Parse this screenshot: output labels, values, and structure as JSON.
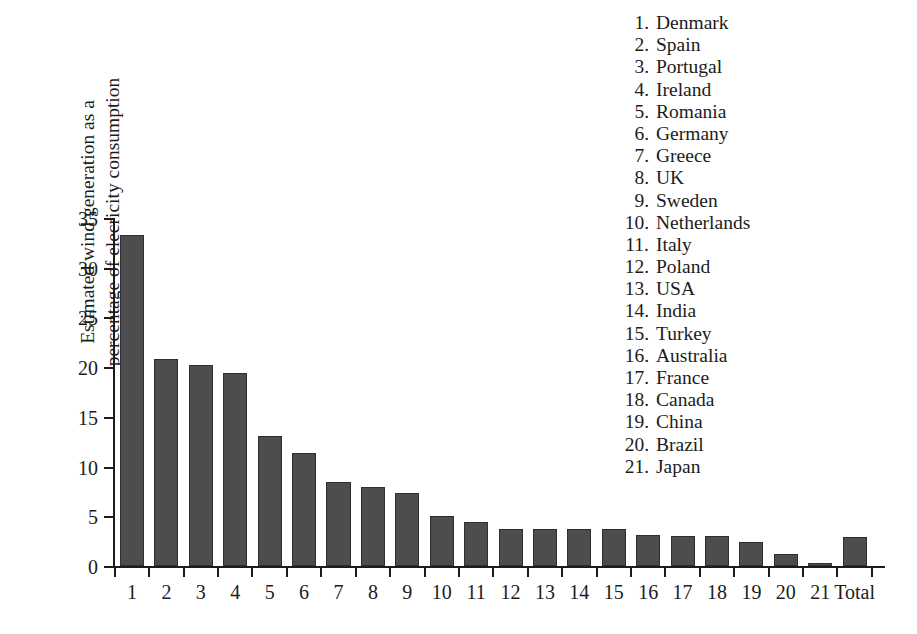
{
  "chart_data": {
    "type": "bar",
    "title": "",
    "xlabel": "",
    "ylabel": "Estimated wind generation as a percentage of elecricity consumption",
    "ylabel_line1": "Estimated wind generation as a",
    "ylabel_line2": "percentage of elecricity consumption",
    "ylim": [
      0,
      35
    ],
    "yticks": [
      0,
      5,
      10,
      15,
      20,
      25,
      30,
      35
    ],
    "ytick_labels": [
      "0",
      "5",
      "10",
      "15",
      "20",
      "25",
      "30",
      "35"
    ],
    "grid": false,
    "legend_position": "top-right",
    "categories": [
      "1",
      "2",
      "3",
      "4",
      "5",
      "6",
      "7",
      "8",
      "9",
      "10",
      "11",
      "12",
      "13",
      "14",
      "15",
      "16",
      "17",
      "18",
      "19",
      "20",
      "21",
      "Total"
    ],
    "values": [
      33.3,
      20.8,
      20.2,
      19.4,
      13.1,
      11.4,
      8.5,
      7.9,
      7.3,
      5.0,
      4.4,
      3.7,
      3.75,
      3.75,
      3.75,
      3.1,
      3.05,
      3.0,
      2.4,
      1.2,
      0.35,
      2.9
    ],
    "series_name": "Estimated wind generation as a percentage of electricity consumption",
    "bar_color": "#4d4d4d",
    "bar_edge_color": "#2f2f2f"
  },
  "legend": {
    "items": [
      {
        "num": "1.",
        "name": "Denmark"
      },
      {
        "num": "2.",
        "name": "Spain"
      },
      {
        "num": "3.",
        "name": "Portugal"
      },
      {
        "num": "4.",
        "name": "Ireland"
      },
      {
        "num": "5.",
        "name": "Romania"
      },
      {
        "num": "6.",
        "name": "Germany"
      },
      {
        "num": "7.",
        "name": "Greece"
      },
      {
        "num": "8.",
        "name": "UK"
      },
      {
        "num": "9.",
        "name": "Sweden"
      },
      {
        "num": "10.",
        "name": "Netherlands"
      },
      {
        "num": "11.",
        "name": "Italy"
      },
      {
        "num": "12.",
        "name": "Poland"
      },
      {
        "num": "13.",
        "name": "USA"
      },
      {
        "num": "14.",
        "name": "India"
      },
      {
        "num": "15.",
        "name": "Turkey"
      },
      {
        "num": "16.",
        "name": "Australia"
      },
      {
        "num": "17.",
        "name": "France"
      },
      {
        "num": "18.",
        "name": "Canada"
      },
      {
        "num": "19.",
        "name": "China"
      },
      {
        "num": "20.",
        "name": "Brazil"
      },
      {
        "num": "21.",
        "name": "Japan"
      }
    ]
  }
}
